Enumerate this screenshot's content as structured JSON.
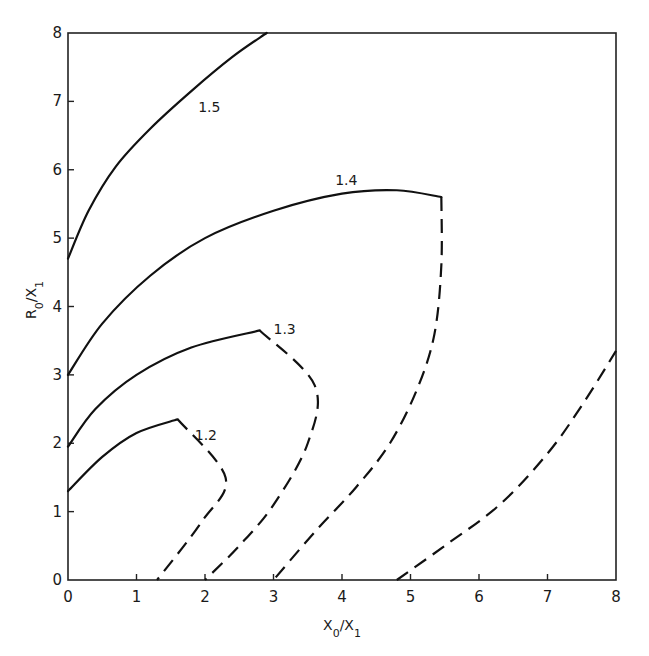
{
  "chart_data": {
    "type": "line",
    "title": "",
    "xlabel": "X0/X1",
    "ylabel": "R0/X1",
    "xlim": [
      0,
      8
    ],
    "ylim": [
      0,
      8
    ],
    "x_ticks": [
      "0",
      "1",
      "2",
      "3",
      "4",
      "5",
      "6",
      "7",
      "8"
    ],
    "y_ticks": [
      "0",
      "1",
      "2",
      "3",
      "4",
      "5",
      "6",
      "7",
      "8"
    ],
    "grid": false,
    "legend": null,
    "series": [
      {
        "name": "1.5",
        "label": "1.5",
        "label_pos": [
          1.9,
          6.85
        ],
        "solid": [
          [
            0,
            4.7
          ],
          [
            0.3,
            5.4
          ],
          [
            0.7,
            6.05
          ],
          [
            1.2,
            6.6
          ],
          [
            1.8,
            7.15
          ],
          [
            2.4,
            7.65
          ],
          [
            2.9,
            8.0
          ]
        ],
        "dashed": []
      },
      {
        "name": "1.4",
        "label": "1.4",
        "label_pos": [
          3.9,
          5.78
        ],
        "solid": [
          [
            0,
            3.0
          ],
          [
            0.5,
            3.75
          ],
          [
            1.2,
            4.45
          ],
          [
            2.0,
            5.0
          ],
          [
            3.0,
            5.4
          ],
          [
            4.0,
            5.65
          ],
          [
            4.8,
            5.7
          ],
          [
            5.45,
            5.6
          ]
        ],
        "dashed": [
          [
            5.45,
            5.6
          ],
          [
            5.45,
            4.6
          ],
          [
            5.35,
            3.6
          ],
          [
            5.1,
            2.8
          ],
          [
            4.7,
            2.0
          ],
          [
            4.2,
            1.35
          ],
          [
            3.6,
            0.7
          ],
          [
            3.0,
            0.0
          ]
        ]
      },
      {
        "name": "1.3",
        "label": "1.3",
        "label_pos": [
          3.0,
          3.6
        ],
        "solid": [
          [
            0,
            1.95
          ],
          [
            0.4,
            2.5
          ],
          [
            1.0,
            3.0
          ],
          [
            1.8,
            3.4
          ],
          [
            2.8,
            3.65
          ]
        ],
        "dashed": [
          [
            2.8,
            3.65
          ],
          [
            3.6,
            2.85
          ],
          [
            3.5,
            2.0
          ],
          [
            3.0,
            1.1
          ],
          [
            2.5,
            0.5
          ],
          [
            2.0,
            0.0
          ]
        ]
      },
      {
        "name": "1.2",
        "label": "1.2",
        "label_pos": [
          1.85,
          2.05
        ],
        "solid": [
          [
            0,
            1.3
          ],
          [
            0.5,
            1.8
          ],
          [
            1.0,
            2.15
          ],
          [
            1.6,
            2.35
          ]
        ],
        "dashed": [
          [
            1.6,
            2.35
          ],
          [
            2.3,
            1.5
          ],
          [
            1.95,
            0.85
          ],
          [
            1.3,
            0.0
          ]
        ]
      },
      {
        "name": "boundary",
        "label": "",
        "label_pos": null,
        "solid": [],
        "dashed": [
          [
            4.8,
            0.0
          ],
          [
            5.5,
            0.5
          ],
          [
            6.3,
            1.1
          ],
          [
            7.0,
            1.85
          ],
          [
            7.5,
            2.55
          ],
          [
            8.0,
            3.35
          ]
        ]
      }
    ]
  }
}
